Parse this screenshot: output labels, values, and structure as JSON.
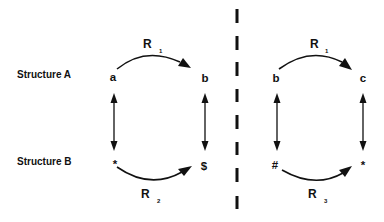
{
  "colors": {
    "ink": "#111111",
    "background": "#ffffff"
  },
  "labels": {
    "structure_a": "Structure A",
    "structure_b": "Structure B"
  },
  "left_panel": {
    "top_left_node": "a",
    "top_right_node": "b",
    "bottom_left_node": "*",
    "bottom_right_node": "$",
    "top_relation": {
      "letter": "R",
      "subscript": "1"
    },
    "bottom_relation": {
      "letter": "R",
      "subscript": "2"
    },
    "vertical_links": [
      "bidirectional",
      "bidirectional"
    ]
  },
  "divider": {
    "style": "dashed-vertical"
  },
  "right_panel": {
    "top_left_node": "b",
    "top_right_node": "c",
    "bottom_left_node": "#",
    "bottom_right_node": "*",
    "top_relation": {
      "letter": "R",
      "subscript": "1"
    },
    "bottom_relation": {
      "letter": "R",
      "subscript": "3"
    },
    "vertical_links": [
      "bidirectional",
      "bidirectional"
    ]
  }
}
